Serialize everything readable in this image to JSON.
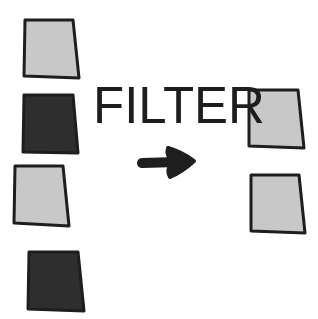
{
  "label": "FILTER",
  "colors": {
    "background": "#ffffff",
    "light_fill": "#c8c8c8",
    "dark_fill": "#2e2e2e",
    "stroke": "#1e1e1e",
    "text": "#1e1e1e",
    "arrow": "#1e1e1e"
  },
  "input_items": [
    {
      "shade": "light",
      "points": "25,20 73,20 79,78 24,76"
    },
    {
      "shade": "dark",
      "points": "24,95 73,95 78,153 23,152"
    },
    {
      "shade": "light",
      "points": "15,166 63,166 69,226 14,223"
    },
    {
      "shade": "dark",
      "points": "29,252 78,252 84,311 28,309"
    }
  ],
  "output_items": [
    {
      "shade": "light",
      "points": "249,90 298,90 304,148 249,146"
    },
    {
      "shade": "light",
      "points": "251,175 299,175 305,233 251,231"
    }
  ],
  "arrow": {
    "direction": "right"
  }
}
